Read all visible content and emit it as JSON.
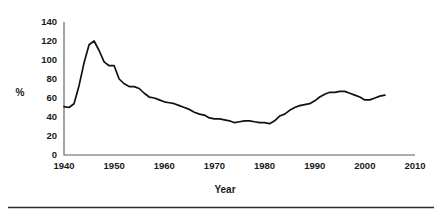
{
  "chart_data": {
    "type": "line",
    "title": "",
    "xlabel": "Year",
    "ylabel": "%",
    "xlim": [
      1940,
      2010
    ],
    "ylim": [
      0,
      140
    ],
    "grid": false,
    "legend": null,
    "x_ticks": [
      1940,
      1950,
      1960,
      1970,
      1980,
      1990,
      2000,
      2010
    ],
    "y_ticks": [
      0,
      20,
      40,
      60,
      80,
      100,
      120,
      140
    ],
    "series": [
      {
        "name": "%",
        "color": "#111111",
        "x": [
          1940,
          1941,
          1942,
          1943,
          1944,
          1945,
          1946,
          1947,
          1948,
          1949,
          1950,
          1951,
          1952,
          1953,
          1954,
          1955,
          1956,
          1957,
          1958,
          1959,
          1960,
          1961,
          1962,
          1963,
          1964,
          1965,
          1966,
          1967,
          1968,
          1969,
          1970,
          1971,
          1972,
          1973,
          1974,
          1975,
          1976,
          1977,
          1978,
          1979,
          1980,
          1981,
          1982,
          1983,
          1984,
          1985,
          1986,
          1987,
          1988,
          1989,
          1990,
          1991,
          1992,
          1993,
          1994,
          1995,
          1996,
          1997,
          1998,
          1999,
          2000,
          2001,
          2002,
          2003,
          2004
        ],
        "y": [
          51,
          50,
          54,
          73,
          97,
          116,
          120,
          110,
          98,
          94,
          94,
          80,
          75,
          72,
          72,
          70,
          65,
          61,
          60,
          58,
          56,
          55,
          54,
          52,
          50,
          48,
          45,
          43,
          42,
          39,
          38,
          38,
          37,
          36,
          34,
          35,
          36,
          36,
          35,
          34,
          34,
          33,
          36,
          41,
          43,
          47,
          50,
          52,
          53,
          54,
          57,
          61,
          64,
          66,
          66,
          67,
          67,
          65,
          63,
          61,
          58,
          58,
          60,
          62,
          63
        ]
      }
    ]
  },
  "axis": {
    "y_label": "%",
    "x_label": "Year",
    "x_tick_labels": [
      "1940",
      "1950",
      "1960",
      "1970",
      "1980",
      "1990",
      "2000",
      "2010"
    ],
    "y_tick_labels": [
      "0",
      "20",
      "40",
      "60",
      "80",
      "100",
      "120",
      "140"
    ]
  }
}
